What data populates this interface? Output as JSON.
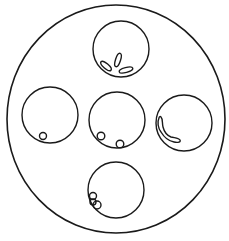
{
  "figure": {
    "stroke_color": "#1a1a1a",
    "background_color": "#ffffff",
    "outer_circle": {
      "cx": 116,
      "cy": 119,
      "rx": 109,
      "ry": 114
    },
    "inner_circles": [
      {
        "id": "top",
        "cx": 121,
        "cy": 49,
        "r": 28,
        "contents": "three elongated petal-like loops at bottom"
      },
      {
        "id": "left",
        "cx": 50,
        "cy": 115,
        "r": 28,
        "contents": "one small loop at bottom-left"
      },
      {
        "id": "center",
        "cx": 117,
        "cy": 120,
        "r": 28,
        "contents": "two small loops at bottom"
      },
      {
        "id": "right",
        "cx": 184,
        "cy": 123,
        "r": 28,
        "contents": "one bent elongated loop along left-bottom wall"
      },
      {
        "id": "bottom",
        "cx": 116,
        "cy": 190,
        "r": 28,
        "contents": "cluster of three small loops at left"
      }
    ]
  }
}
